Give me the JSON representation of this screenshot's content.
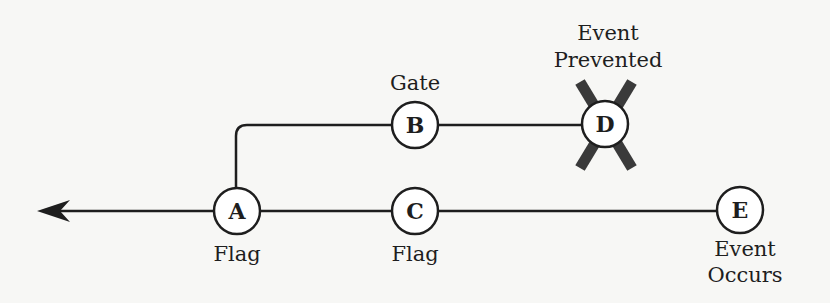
{
  "diagram": {
    "type": "event-tree",
    "colors": {
      "background": "#f7f7f5",
      "line": "#1e1e1e",
      "node_fill": "#ffffff",
      "cross": "#3a3a3a"
    },
    "nodes": {
      "A": {
        "letter": "A",
        "label_lines": [
          "Flag"
        ]
      },
      "B": {
        "letter": "B",
        "label_lines": [
          "Gate"
        ]
      },
      "C": {
        "letter": "C",
        "label_lines": [
          "Flag"
        ]
      },
      "D": {
        "letter": "D",
        "label_lines": [
          "Event",
          "Prevented"
        ],
        "crossed_out": true
      },
      "E": {
        "letter": "E",
        "label_lines": [
          "Event",
          "Occurs"
        ]
      }
    },
    "edges": [
      {
        "from": "E",
        "to": "C"
      },
      {
        "from": "C",
        "to": "A"
      },
      {
        "from": "A",
        "to": "left-arrow"
      },
      {
        "from": "A",
        "to": "B"
      },
      {
        "from": "B",
        "to": "D"
      }
    ]
  }
}
